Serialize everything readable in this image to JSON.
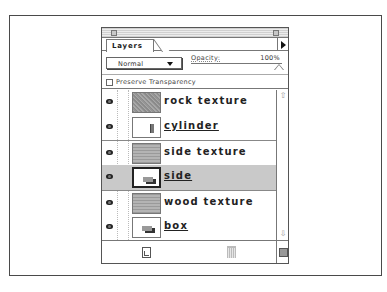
{
  "palette": {
    "tab_label": "Layers",
    "blend_mode": "Normal",
    "opacity_label": "Opacity:",
    "opacity_value": "100%",
    "preserve_transparency_label": "Preserve Transparency",
    "preserve_transparency_checked": false
  },
  "layers": [
    {
      "name": "rock texture",
      "visible": true,
      "thumb": "rock",
      "clipping_base": false,
      "selected": false
    },
    {
      "name": "cylinder",
      "visible": true,
      "thumb": "cylinder",
      "clipping_base": true,
      "selected": false
    },
    {
      "name": "side texture",
      "visible": true,
      "thumb": "stripes",
      "clipping_base": false,
      "selected": false
    },
    {
      "name": "side",
      "visible": true,
      "thumb": "box",
      "clipping_base": true,
      "selected": true
    },
    {
      "name": "wood texture",
      "visible": true,
      "thumb": "stripes",
      "clipping_base": false,
      "selected": false
    },
    {
      "name": "box",
      "visible": true,
      "thumb": "box",
      "clipping_base": true,
      "selected": false
    }
  ],
  "scrollbar": {
    "up_icon": "⇧",
    "down_icon": "⇩"
  },
  "colors": {
    "selected_row": "#c9c9c9",
    "border": "#777777"
  }
}
